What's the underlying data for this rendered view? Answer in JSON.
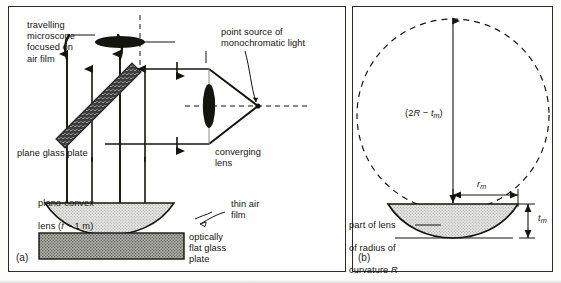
{
  "figure": {
    "panels": [
      {
        "tag": "(a)",
        "name": "newtons-rings-apparatus"
      },
      {
        "tag": "(b)",
        "name": "lens-curvature-geometry"
      }
    ]
  },
  "panel_a": {
    "tag": "(a)",
    "labels": {
      "microscope": "travelling\nmicroscope\nfocused on\nair film",
      "point_source": "point source of\nmonochromatic light",
      "converging_lens": "converging\nlens",
      "plane_glass_plate": "plane glass plate",
      "plano_convex_lens_line1": "plano-convex",
      "plano_convex_lens_line2_pre": "lens (",
      "plano_convex_lens_f": "f",
      "plano_convex_lens_line2_post": " ~ 1 m)",
      "thin_air_film": "thin air\nfilm",
      "flat_glass_plate": "optically\nflat glass\nplate"
    },
    "icons": {
      "objective": "microscope-objective-lens-icon",
      "beam_splitter": "beam-splitter-plate-icon",
      "source_lens": "converging-lens-icon",
      "ray_arrow": "ray-arrow-icon"
    }
  },
  "panel_b": {
    "tag": "(b)",
    "labels": {
      "diameter_pre": "(2",
      "diameter_R": "R",
      "diameter_minus": " − ",
      "diameter_t": "t",
      "diameter_sub": "m",
      "diameter_post": ")",
      "radius_r": "r",
      "radius_sub": "m",
      "thickness_t": "t",
      "thickness_sub": "m",
      "lens_note_line1": "part of lens",
      "lens_note_line2": "of radius of",
      "lens_note_line3_pre": "curvature ",
      "lens_note_line3_R": "R"
    },
    "icons": {
      "circle": "dashed-circle-icon",
      "dimension_arrow": "dimension-arrow-icon"
    }
  },
  "colors": {
    "ink": "#15150f",
    "border": "#2b2b2b",
    "lens_fill": "#d9d9d4",
    "glass_fill": "#9c9c96",
    "splitter_fill": "#707070",
    "paper": "#ffffff"
  }
}
